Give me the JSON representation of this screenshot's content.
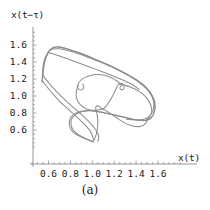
{
  "figure": {
    "caption": "(a)",
    "background_color": "#ffffff",
    "curve_color": "#8e8e8e",
    "axis_color": "#8a8a8a",
    "text_color": "#1a1a1a"
  },
  "chart_data": {
    "type": "line",
    "title": "",
    "subtitle": "",
    "xlabel": "x(t)",
    "ylabel": "x(t−τ)",
    "annotations": [
      "(a)"
    ],
    "legend": [],
    "legend_position": "none",
    "grid": false,
    "xlim": [
      0.48,
      1.72
    ],
    "ylim": [
      0.42,
      1.68
    ],
    "xticks": [
      0.6,
      0.8,
      1.0,
      1.2,
      1.4,
      1.6
    ],
    "xticklabels": [
      "0.6",
      "0.8",
      "1.0",
      "1.2",
      "1.4",
      "1.6"
    ],
    "yticks": [
      0.6,
      0.8,
      1.0,
      1.2,
      1.4,
      1.6
    ],
    "yticklabels": [
      "0.6",
      "0.8",
      "1.0",
      "1.2",
      "1.4",
      "1.6"
    ],
    "series": [
      {
        "name": "outer-orbit-1",
        "points": [
          [
            0.545,
            1.205
          ],
          [
            0.555,
            1.33
          ],
          [
            0.57,
            1.43
          ],
          [
            0.6,
            1.52
          ],
          [
            0.64,
            1.57
          ],
          [
            0.69,
            1.58
          ],
          [
            0.76,
            1.56
          ],
          [
            0.85,
            1.52
          ],
          [
            0.96,
            1.465
          ],
          [
            1.08,
            1.4
          ],
          [
            1.2,
            1.33
          ],
          [
            1.32,
            1.25
          ],
          [
            1.42,
            1.17
          ],
          [
            1.5,
            1.08
          ],
          [
            1.55,
            0.985
          ],
          [
            1.57,
            0.89
          ],
          [
            1.562,
            0.805
          ],
          [
            1.54,
            0.745
          ],
          [
            1.505,
            0.715
          ],
          [
            1.44,
            0.712
          ],
          [
            1.35,
            0.73
          ],
          [
            1.25,
            0.76
          ],
          [
            1.15,
            0.79
          ],
          [
            1.06,
            0.815
          ],
          [
            0.98,
            0.83
          ],
          [
            0.9,
            0.82
          ],
          [
            0.84,
            0.79
          ],
          [
            0.8,
            0.74
          ],
          [
            0.79,
            0.68
          ],
          [
            0.8,
            0.62
          ],
          [
            0.83,
            0.57
          ],
          [
            0.88,
            0.53
          ],
          [
            0.93,
            0.5
          ],
          [
            0.975,
            0.48
          ],
          [
            1.0,
            0.462
          ]
        ]
      },
      {
        "name": "outer-orbit-2",
        "points": [
          [
            0.548,
            1.245
          ],
          [
            0.558,
            1.36
          ],
          [
            0.578,
            1.455
          ],
          [
            0.612,
            1.535
          ],
          [
            0.655,
            1.572
          ],
          [
            0.712,
            1.572
          ],
          [
            0.79,
            1.548
          ],
          [
            0.89,
            1.505
          ],
          [
            1.0,
            1.448
          ],
          [
            1.12,
            1.382
          ],
          [
            1.24,
            1.31
          ],
          [
            1.35,
            1.232
          ],
          [
            1.45,
            1.15
          ],
          [
            1.52,
            1.06
          ],
          [
            1.562,
            0.965
          ],
          [
            1.575,
            0.875
          ],
          [
            1.562,
            0.795
          ],
          [
            1.532,
            0.742
          ],
          [
            1.49,
            0.718
          ],
          [
            1.42,
            0.718
          ],
          [
            1.33,
            0.74
          ],
          [
            1.23,
            0.77
          ],
          [
            1.13,
            0.798
          ],
          [
            1.045,
            0.818
          ],
          [
            0.965,
            0.828
          ],
          [
            0.895,
            0.812
          ],
          [
            0.845,
            0.78
          ],
          [
            0.812,
            0.73
          ],
          [
            0.805,
            0.672
          ],
          [
            0.82,
            0.612
          ],
          [
            0.855,
            0.562
          ],
          [
            0.905,
            0.522
          ],
          [
            0.955,
            0.492
          ],
          [
            0.995,
            0.47
          ],
          [
            1.01,
            0.458
          ]
        ]
      },
      {
        "name": "outer-orbit-3",
        "points": [
          [
            0.54,
            1.16
          ],
          [
            0.545,
            1.265
          ],
          [
            0.552,
            1.37
          ],
          [
            0.57,
            1.45
          ],
          [
            0.598,
            1.518
          ],
          [
            0.638,
            1.552
          ],
          [
            0.695,
            1.555
          ],
          [
            0.775,
            1.535
          ],
          [
            0.88,
            1.495
          ],
          [
            0.995,
            1.44
          ],
          [
            1.12,
            1.375
          ],
          [
            1.245,
            1.3
          ],
          [
            1.36,
            1.22
          ],
          [
            1.455,
            1.135
          ],
          [
            1.525,
            1.045
          ],
          [
            1.558,
            0.95
          ],
          [
            1.56,
            0.862
          ],
          [
            1.54,
            0.79
          ],
          [
            1.505,
            0.745
          ],
          [
            1.455,
            0.722
          ],
          [
            1.39,
            0.718
          ],
          [
            1.315,
            0.725
          ]
        ]
      },
      {
        "name": "left-descent-branch",
        "points": [
          [
            0.54,
            1.19
          ],
          [
            0.56,
            1.15
          ],
          [
            0.6,
            1.085
          ],
          [
            0.65,
            1.01
          ],
          [
            0.705,
            0.935
          ],
          [
            0.765,
            0.862
          ],
          [
            0.825,
            0.792
          ],
          [
            0.88,
            0.728
          ],
          [
            0.925,
            0.672
          ],
          [
            0.96,
            0.622
          ],
          [
            0.985,
            0.578
          ],
          [
            1.0,
            0.535
          ],
          [
            1.008,
            0.498
          ],
          [
            1.01,
            0.47
          ]
        ]
      },
      {
        "name": "left-descent-branch-2",
        "points": [
          [
            0.548,
            1.245
          ],
          [
            0.575,
            1.198
          ],
          [
            0.618,
            1.132
          ],
          [
            0.672,
            1.055
          ],
          [
            0.732,
            0.978
          ],
          [
            0.795,
            0.902
          ],
          [
            0.858,
            0.83
          ],
          [
            0.915,
            0.765
          ],
          [
            0.962,
            0.706
          ],
          [
            1.0,
            0.655
          ],
          [
            1.028,
            0.608
          ],
          [
            1.048,
            0.565
          ],
          [
            1.058,
            0.525
          ],
          [
            1.058,
            0.49
          ],
          [
            1.048,
            0.468
          ]
        ]
      },
      {
        "name": "bottom-vertical-loop",
        "points": [
          [
            1.01,
            0.47
          ],
          [
            1.022,
            0.5
          ],
          [
            1.035,
            0.545
          ],
          [
            1.045,
            0.6
          ],
          [
            1.05,
            0.662
          ],
          [
            1.05,
            0.72
          ],
          [
            1.045,
            0.775
          ],
          [
            1.038,
            0.818
          ],
          [
            1.032,
            0.848
          ],
          [
            1.032,
            0.87
          ],
          [
            1.04,
            0.882
          ],
          [
            1.055,
            0.882
          ],
          [
            1.072,
            0.868
          ],
          [
            1.092,
            0.842
          ]
        ]
      },
      {
        "name": "inner-heart-loop",
        "points": [
          [
            1.095,
            0.84
          ],
          [
            1.13,
            0.89
          ],
          [
            1.16,
            0.945
          ],
          [
            1.185,
            1.0
          ],
          [
            1.205,
            1.052
          ],
          [
            1.222,
            1.098
          ],
          [
            1.238,
            1.132
          ],
          [
            1.255,
            1.148
          ],
          [
            1.272,
            1.148
          ],
          [
            1.285,
            1.13
          ],
          [
            1.29,
            1.105
          ],
          [
            1.285,
            1.082
          ],
          [
            1.272,
            1.072
          ],
          [
            1.258,
            1.078
          ],
          [
            1.252,
            1.095
          ],
          [
            1.258,
            1.112
          ],
          [
            1.272,
            1.125
          ],
          [
            1.25,
            1.152
          ],
          [
            1.218,
            1.182
          ],
          [
            1.18,
            1.212
          ],
          [
            1.135,
            1.235
          ],
          [
            1.085,
            1.25
          ],
          [
            1.035,
            1.252
          ],
          [
            0.985,
            1.242
          ],
          [
            0.94,
            1.222
          ],
          [
            0.905,
            1.195
          ],
          [
            0.88,
            1.162
          ],
          [
            0.868,
            1.128
          ],
          [
            0.868,
            1.098
          ],
          [
            0.878,
            1.078
          ],
          [
            0.895,
            1.07
          ],
          [
            0.912,
            1.078
          ],
          [
            0.922,
            1.098
          ],
          [
            0.92,
            1.122
          ],
          [
            0.908,
            1.142
          ]
        ]
      },
      {
        "name": "inner-left-arc",
        "points": [
          [
            0.87,
            1.13
          ],
          [
            0.862,
            1.096
          ],
          [
            0.855,
            1.055
          ],
          [
            0.852,
            1.012
          ],
          [
            0.858,
            0.968
          ],
          [
            0.872,
            0.928
          ],
          [
            0.895,
            0.892
          ],
          [
            0.925,
            0.862
          ],
          [
            0.96,
            0.842
          ],
          [
            0.998,
            0.832
          ],
          [
            1.035,
            0.832
          ],
          [
            1.068,
            0.84
          ],
          [
            1.095,
            0.852
          ]
        ]
      },
      {
        "name": "mid-descent-to-corner",
        "points": [
          [
            1.095,
            0.852
          ],
          [
            1.14,
            0.815
          ],
          [
            1.185,
            0.775
          ],
          [
            1.228,
            0.738
          ],
          [
            1.268,
            0.705
          ],
          [
            1.305,
            0.678
          ],
          [
            1.34,
            0.658
          ],
          [
            1.375,
            0.645
          ],
          [
            1.408,
            0.64
          ],
          [
            1.438,
            0.642
          ],
          [
            1.462,
            0.652
          ],
          [
            1.48,
            0.668
          ],
          [
            1.492,
            0.69
          ],
          [
            1.498,
            0.715
          ],
          [
            1.5,
            0.742
          ]
        ]
      },
      {
        "name": "upper-right-inner-arc",
        "points": [
          [
            1.24,
            1.14
          ],
          [
            1.3,
            1.125
          ],
          [
            1.362,
            1.098
          ],
          [
            1.42,
            1.06
          ],
          [
            1.47,
            1.012
          ],
          [
            1.508,
            0.958
          ],
          [
            1.532,
            0.9
          ],
          [
            1.542,
            0.842
          ],
          [
            1.538,
            0.792
          ],
          [
            1.522,
            0.755
          ],
          [
            1.5,
            0.735
          ]
        ]
      },
      {
        "name": "upper-inner-diagonal",
        "points": [
          [
            0.6,
            1.51
          ],
          [
            0.68,
            1.478
          ],
          [
            0.77,
            1.438
          ],
          [
            0.87,
            1.392
          ],
          [
            0.975,
            1.342
          ],
          [
            1.08,
            1.292
          ],
          [
            1.18,
            1.242
          ],
          [
            1.262,
            1.198
          ],
          [
            1.33,
            1.158
          ],
          [
            1.385,
            1.118
          ],
          [
            1.425,
            1.078
          ]
        ]
      }
    ]
  }
}
